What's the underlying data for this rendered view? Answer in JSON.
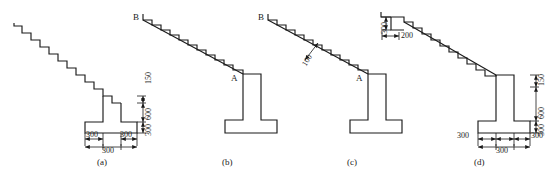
{
  "figure": {
    "type": "engineering-drawing",
    "panel_count": 4
  },
  "panels": [
    {
      "id": "a",
      "caption": "(a)",
      "points": [],
      "dimensions": {
        "right_stack": [
          "150",
          "600",
          "300"
        ],
        "bottom_inner_left": "300",
        "bottom_inner_right": "300",
        "bottom_outer": "300"
      }
    },
    {
      "id": "b",
      "caption": "(b)",
      "points": [
        "B",
        "A"
      ],
      "dimensions": {}
    },
    {
      "id": "c",
      "caption": "(c)",
      "points": [
        "B",
        "A"
      ],
      "dimensions": {
        "waist_thickness": "100"
      }
    },
    {
      "id": "d",
      "caption": "(d)",
      "points": [],
      "dimensions": {
        "riser": "300",
        "tread": "200",
        "right_stack": [
          "150",
          "600",
          "300"
        ],
        "bottom_outer_left": "300",
        "bottom_center": "300",
        "bottom_outer_right": "300"
      }
    }
  ],
  "labels": {
    "cap_a": "(a)",
    "cap_b": "(b)",
    "cap_c": "(c)",
    "cap_d": "(d)",
    "b_point_b": "B",
    "b_point_a": "A",
    "c_point_b": "B",
    "c_point_a": "A",
    "c_waist": "100",
    "a_150": "150",
    "a_600": "600",
    "a_300v": "300",
    "a_300l": "300",
    "a_300r": "300",
    "a_300b": "300",
    "d_riser": "300",
    "d_tread": "200",
    "d_150": "150",
    "d_600": "600",
    "d_300v": "300",
    "d_300l": "300",
    "d_300c": "300",
    "d_300r": "300"
  },
  "style": {
    "line_color": "#1a1a1a",
    "background": "#ffffff"
  }
}
